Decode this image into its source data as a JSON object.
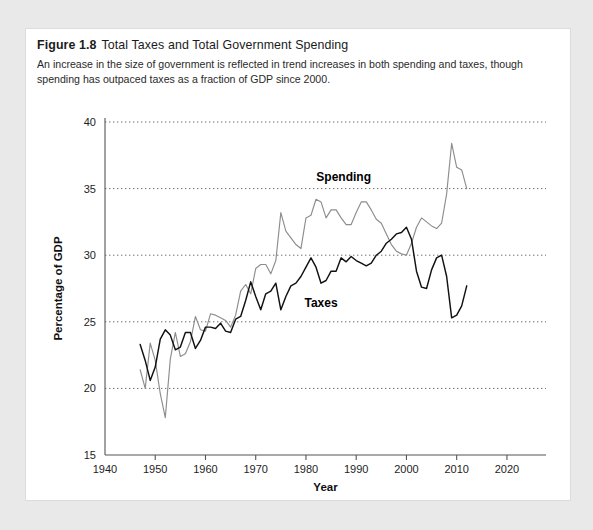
{
  "figure": {
    "number_label": "Figure 1.8",
    "title": "Total Taxes and Total Government Spending",
    "description": "An increase in the size of government is reflected in trend increases in both spending and taxes, though spending has outpaced taxes as a fraction of GDP since 2000."
  },
  "colors": {
    "page_background": "#e9e9e9",
    "figure_background": "#ffffff",
    "spending_line": "#8d8d8d",
    "taxes_line": "#111111",
    "gridline": "#6d6d6d",
    "axis": "#555555",
    "text": "#1b1b1b"
  },
  "chart_data": {
    "type": "line",
    "title": "Total Taxes and Total Government Spending",
    "xlabel": "Year",
    "ylabel": "Percentage of GDP",
    "xlim": [
      1940,
      2023
    ],
    "ylim": [
      15,
      40
    ],
    "xticks": [
      1940,
      1950,
      1960,
      1970,
      1980,
      1990,
      2000,
      2010,
      2020
    ],
    "yticks": [
      15,
      20,
      25,
      30,
      35,
      40
    ],
    "grid": "horizontal-dotted",
    "legend": "inline-annotations",
    "annotations": [
      {
        "text": "Spending",
        "x": 1987.5,
        "y": 35.6
      },
      {
        "text": "Taxes",
        "x": 1983.0,
        "y": 26.1
      }
    ],
    "x": [
      1947,
      1948,
      1949,
      1950,
      1951,
      1952,
      1953,
      1954,
      1955,
      1956,
      1957,
      1958,
      1959,
      1960,
      1961,
      1962,
      1963,
      1964,
      1965,
      1966,
      1967,
      1968,
      1969,
      1970,
      1971,
      1972,
      1973,
      1974,
      1975,
      1976,
      1977,
      1978,
      1979,
      1980,
      1981,
      1982,
      1983,
      1984,
      1985,
      1986,
      1987,
      1988,
      1989,
      1990,
      1991,
      1992,
      1993,
      1994,
      1995,
      1996,
      1997,
      1998,
      1999,
      2000,
      2001,
      2002,
      2003,
      2004,
      2005,
      2006,
      2007,
      2008,
      2009,
      2010,
      2011,
      2012
    ],
    "series": [
      {
        "name": "Spending",
        "color": "#8d8d8d",
        "values": [
          21.4,
          20.0,
          23.4,
          22.1,
          19.6,
          17.8,
          22.2,
          24.2,
          22.4,
          22.6,
          23.5,
          25.4,
          24.4,
          24.3,
          25.6,
          25.5,
          25.3,
          25.1,
          24.6,
          25.5,
          27.3,
          27.8,
          27.1,
          29.0,
          29.3,
          29.3,
          28.6,
          29.6,
          33.2,
          31.8,
          31.3,
          30.8,
          30.5,
          32.8,
          33.0,
          34.2,
          34.0,
          32.8,
          33.4,
          33.4,
          32.8,
          32.3,
          32.3,
          33.2,
          34.0,
          34.0,
          33.4,
          32.7,
          32.4,
          31.6,
          30.8,
          30.3,
          30.1,
          30.0,
          30.9,
          32.1,
          32.8,
          32.5,
          32.2,
          32.0,
          32.4,
          34.6,
          38.4,
          36.6,
          36.4,
          35.0
        ]
      },
      {
        "name": "Taxes",
        "color": "#111111",
        "values": [
          23.3,
          22.1,
          20.6,
          21.6,
          23.7,
          24.4,
          24.0,
          22.9,
          23.1,
          24.2,
          24.2,
          23.0,
          23.6,
          24.6,
          24.6,
          24.5,
          24.9,
          24.3,
          24.2,
          25.2,
          25.4,
          26.6,
          28.0,
          26.9,
          25.9,
          27.1,
          27.3,
          27.9,
          25.9,
          26.9,
          27.7,
          27.9,
          28.4,
          29.1,
          29.8,
          29.1,
          27.9,
          28.1,
          28.8,
          28.8,
          29.8,
          29.5,
          29.9,
          29.6,
          29.4,
          29.2,
          29.4,
          30.0,
          30.3,
          30.9,
          31.2,
          31.6,
          31.7,
          32.1,
          31.2,
          28.8,
          27.6,
          27.5,
          28.9,
          29.8,
          30.0,
          28.4,
          25.3,
          25.5,
          26.2,
          27.7
        ]
      }
    ]
  }
}
